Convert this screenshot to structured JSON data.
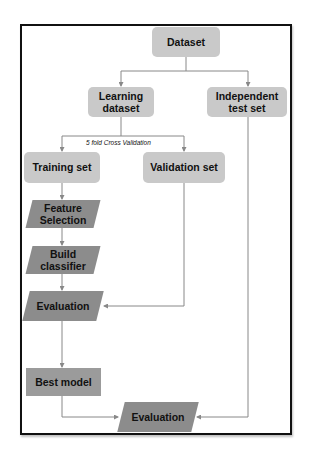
{
  "diagram": {
    "type": "flowchart",
    "nodes": {
      "dataset": "Dataset",
      "learning_dataset": "Learning dataset",
      "independent_test_set": "Independent test set",
      "training_set": "Training set",
      "validation_set": "Validation set",
      "feature_selection": "Feature Selection",
      "build_classifier": "Build classifier",
      "evaluation_cv": "Evaluation",
      "best_model": "Best model",
      "evaluation_final": "Evaluation"
    },
    "edge_labels": {
      "cross_validation": "5 fold Cross Validation"
    },
    "colors": {
      "rounded_box": "#c9c9c9",
      "process_parallelogram": "#8c8c8c",
      "best_model_box": "#9b9b9b",
      "connector": "#888888",
      "frame": "#111111"
    }
  }
}
